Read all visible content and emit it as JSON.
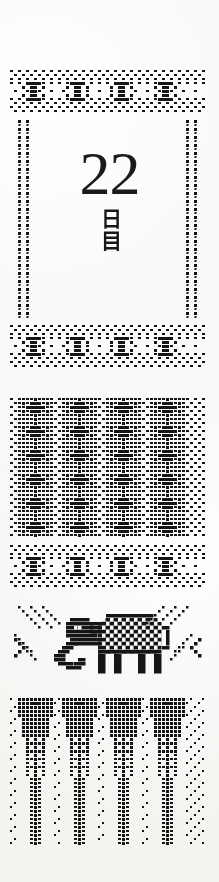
{
  "page": {
    "title": "22 日目",
    "background_color": "#f4f3f0",
    "ink_color": "#151515",
    "width": 219,
    "height": 882
  },
  "date_block": {
    "day_number": "22",
    "day_label": "日目",
    "name": "day-counter"
  },
  "bands": [
    {
      "id": "band-top-bowtie",
      "motif": "bowtie-row",
      "label": "Top border band",
      "repeats": 4,
      "top": 70,
      "height": 48
    },
    {
      "id": "band-side-rules",
      "motif": "dotted-vertical-rules",
      "label": "Side dotted rules",
      "repeats": 4,
      "top": 120,
      "height": 200
    },
    {
      "id": "band-mid-bowtie",
      "motif": "bowtie-row",
      "label": "Middle border band",
      "repeats": 4,
      "top": 325,
      "height": 48
    },
    {
      "id": "band-lattice",
      "motif": "diamond-lattice",
      "label": "Diamond lattice band",
      "repeats": 4,
      "top": 398,
      "height": 140
    },
    {
      "id": "band-lower-bowtie",
      "motif": "bowtie-row",
      "label": "Lower border band",
      "repeats": 4,
      "top": 545,
      "height": 48
    },
    {
      "id": "band-elephant",
      "motif": "elephant-with-rays",
      "label": "Elephant panel",
      "repeats": 1,
      "top": 602,
      "height": 92
    },
    {
      "id": "band-pines",
      "motif": "tapering-pine",
      "label": "Pine tree band",
      "repeats": 4,
      "top": 698,
      "height": 148
    }
  ],
  "icons": {
    "bowtie": "bowtie-icon",
    "elephant": "elephant-icon",
    "chevron_left": "chevron-left-icon",
    "chevron_right": "chevron-right-icon",
    "pine": "pine-tree-icon",
    "diamond": "diamond-icon"
  }
}
